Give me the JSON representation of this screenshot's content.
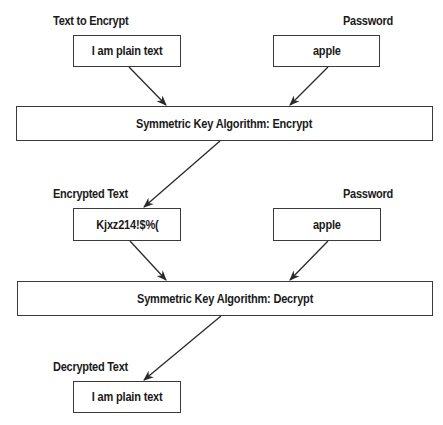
{
  "diagram": {
    "encrypt_stage": {
      "input_label": "Text to Encrypt",
      "input_value": "I am plain text",
      "password_label": "Password",
      "password_value": "apple",
      "algorithm": "Symmetric Key Algorithm: Encrypt"
    },
    "decrypt_stage": {
      "input_label": "Encrypted Text",
      "input_value": "Kjxz214!$%(",
      "password_label": "Password",
      "password_value": "apple",
      "algorithm": "Symmetric Key Algorithm: Decrypt"
    },
    "output": {
      "label": "Decrypted Text",
      "value": "I am plain text"
    },
    "colors": {
      "stroke": "#3a3a3a",
      "text": "#1a1a1a",
      "background": "#ffffff"
    }
  }
}
